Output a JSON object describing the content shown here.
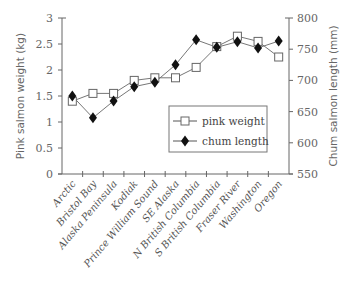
{
  "chart_data": {
    "type": "line",
    "title": "",
    "xlabel": "",
    "ylabel": "Pink salmon weight (kg)",
    "y2label": "Chum salmon length (mm)",
    "ylim": [
      0,
      3
    ],
    "y2lim": [
      550,
      800
    ],
    "yticks": [
      "0",
      "0.5",
      "1",
      "1.5",
      "2",
      "2.5",
      "3"
    ],
    "y2ticks": [
      "550",
      "600",
      "650",
      "700",
      "750",
      "800"
    ],
    "categories": [
      "Arctic",
      "Bristol Bay",
      "Alaska Peninsula",
      "Kodiak",
      "Prince William Sound",
      "SE Alaska",
      "N British Columbia",
      "S British Columbia",
      "Fraser River",
      "Washington",
      "Oregon"
    ],
    "series": [
      {
        "name": "pink weight",
        "axis": "left",
        "marker": "open-square",
        "values": [
          1.4,
          1.55,
          1.55,
          1.8,
          1.85,
          1.85,
          2.05,
          2.45,
          2.65,
          2.55,
          2.25
        ]
      },
      {
        "name": "chum length",
        "axis": "right",
        "marker": "filled-diamond",
        "values": [
          675,
          640,
          667,
          690,
          697,
          725,
          765,
          753,
          762,
          752,
          763
        ]
      }
    ],
    "grid": false,
    "legend_position": "inside-lower-right"
  },
  "legend": {
    "items": [
      "pink weight",
      "chum length"
    ]
  },
  "colors": {
    "axis": "#666666",
    "line": "#777777",
    "marker": "#111111"
  }
}
